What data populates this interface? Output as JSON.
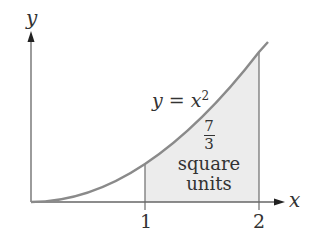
{
  "diagram": {
    "axes": {
      "x_label": "x",
      "y_label": "y",
      "x_ticks": [
        "1",
        "2"
      ]
    },
    "curve": {
      "equation_lhs": "y = x",
      "equation_exponent": "2",
      "function": "x^2"
    },
    "shaded_region": {
      "from": 1,
      "to": 2,
      "area_numerator": "7",
      "area_denominator": "3",
      "area_units_line1": "square",
      "area_units_line2": "units",
      "fill_color": "#ececec"
    },
    "colors": {
      "curve": "#8a8a8a",
      "axis": "#555555",
      "text": "#333333"
    }
  }
}
